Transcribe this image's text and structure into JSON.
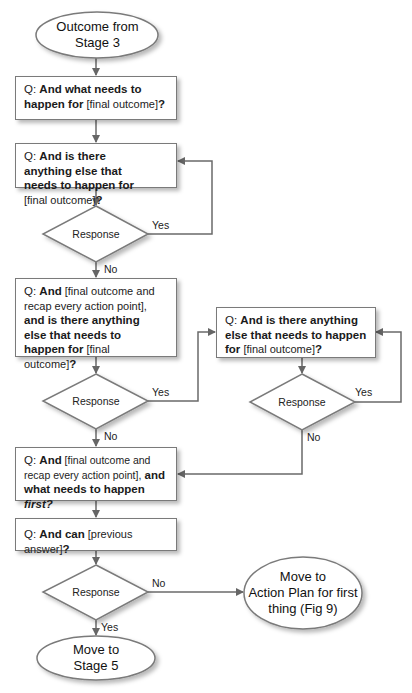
{
  "diagram": {
    "type": "flowchart",
    "start": {
      "label_line1": "Outcome from",
      "label_line2": "Stage 3"
    },
    "box1": {
      "prefix": "Q: ",
      "bold1": "And what needs to happen for",
      "plain1": " [final outcome]",
      "bold2": "?"
    },
    "box2": {
      "prefix": "Q: ",
      "bold1": "And is there anything else that needs to happen for",
      "plain1": " [final outcome]",
      "bold2": "?"
    },
    "decision1": {
      "label": "Response",
      "yes": "Yes",
      "no": "No"
    },
    "box3": {
      "prefix": "Q: ",
      "bold1": "And",
      "plain1": " [final outcome and recap every action point],",
      "bold2": "and is there anything else that needs to happen for",
      "plain2": " [final outcome]",
      "bold3": "?"
    },
    "decision2": {
      "label": "Response",
      "yes": "Yes",
      "no": "No"
    },
    "box_right": {
      "prefix": "Q: ",
      "bold1": "And is there anything else that needs to happen for",
      "plain1": " [final outcome]",
      "bold2": "?"
    },
    "decision_right": {
      "label": "Response",
      "yes": "Yes",
      "no": "No"
    },
    "box4": {
      "prefix": "Q: ",
      "bold1": "And",
      "plain1": " [final outcome and recap every action point],",
      "bold2": " and what needs to happen ",
      "italic": "first?"
    },
    "box5": {
      "prefix": "Q: ",
      "bold1": "And can",
      "plain1": " [previous answer]",
      "bold2": "?"
    },
    "decision3": {
      "label": "Response",
      "yes": "Yes",
      "no": "No"
    },
    "end_left": {
      "label_line1": "Move to",
      "label_line2": "Stage 5"
    },
    "end_right": {
      "label_line1": "Move to",
      "label_line2": "Action Plan for first",
      "label_line3": "thing (Fig 9)"
    }
  },
  "colors": {
    "line": "#6a6a6a",
    "border": "#7a7a7a",
    "fill": "#ffffff"
  }
}
